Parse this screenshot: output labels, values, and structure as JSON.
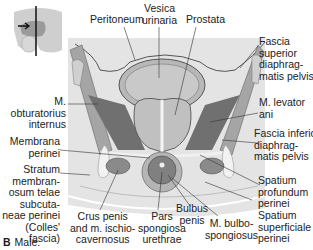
{
  "figure": {
    "caption_letter": "B",
    "caption_text": "Male.",
    "colors": {
      "background_panel": "#e6e6e6",
      "tissue_light": "#c8c8c8",
      "tissue_mid": "#a8a8a8",
      "tissue_dark": "#6e6e6e",
      "muscle": "#9a9a9a",
      "fascia": "#f2f2f2",
      "leader_line": "#333333"
    },
    "labels": {
      "peritoneum": "Peritoneum",
      "vesica_urinaria": "Vesica\nurinaria",
      "prostata": "Prostata",
      "fascia_superior": "Fascia\nsuperior\ndiaphrag-\nmatis pelvis",
      "m_levator_ani": "M. levator\nani",
      "m_obturatorius": "M.\nobturatorius\ninternus",
      "membrana_perinei": "Membrana\nperinei",
      "fascia_inferior": "Fascia inferior\ndiaphrag-\nmatis pelvis",
      "stratum": "Stratum\nmembran-\nosum telae\nsubcuta-\nneae perinei\n(Colles'\nfascia)",
      "spatium_profundum": "Spatium\nprofundum\nperinei",
      "crus_penis": "Crus penis\nand m. ischio-\ncavernosus",
      "pars_spongiosa": "Pars\nspongiosa\nurethrae",
      "bulbus_penis": "Bulbus\npenis",
      "m_bulbospongiosus": "M. bulbo-\nspongiosus",
      "spatium_superficiale": "Spatium\nsuperficiale\nperinei"
    },
    "thumbnail": {
      "name": "orientation-thumbnail",
      "arrow": "→"
    }
  }
}
